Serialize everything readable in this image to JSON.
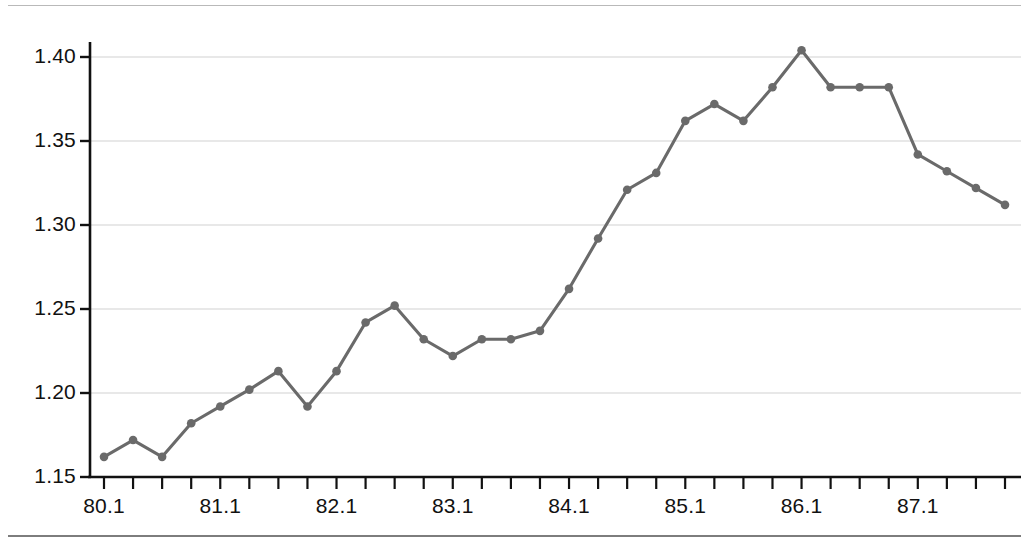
{
  "chart_data": {
    "type": "line",
    "title": "",
    "subtitle": "",
    "xlabel": "",
    "ylabel": "",
    "grid": true,
    "legend": false,
    "legend_position": "none",
    "series_color": "#6a6a6a",
    "marker": "circle",
    "xlim": [
      1980.1,
      87.4
    ],
    "ylim": [
      1.15,
      1.4125
    ],
    "yticks": [
      1.15,
      1.2,
      1.25,
      1.3,
      1.35,
      1.4
    ],
    "ytick_labels": [
      "1.15",
      "1.20",
      "1.25",
      "1.30",
      "1.35",
      "1.40"
    ],
    "xtick_labels": [
      "80.1",
      "81.1",
      "82.1",
      "83.1",
      "84.1",
      "85.1",
      "86.1",
      "87.1"
    ],
    "xtick_label_index": [
      0,
      4,
      8,
      12,
      16,
      20,
      24,
      28
    ],
    "x": [
      "80.1",
      "80.2",
      "80.3",
      "80.4",
      "81.1",
      "81.2",
      "81.3",
      "81.4",
      "82.1",
      "82.2",
      "82.3",
      "82.4",
      "83.1",
      "83.2",
      "83.3",
      "83.4",
      "84.1",
      "84.2",
      "84.3",
      "84.4",
      "85.1",
      "85.2",
      "85.3",
      "85.4",
      "86.1",
      "86.2",
      "86.3",
      "86.4",
      "87.1",
      "87.2",
      "87.3",
      "87.4"
    ],
    "series": [
      {
        "name": "series-1",
        "values": [
          1.162,
          1.172,
          1.162,
          1.182,
          1.192,
          1.202,
          1.213,
          1.192,
          1.213,
          1.242,
          1.252,
          1.232,
          1.222,
          1.232,
          1.232,
          1.237,
          1.262,
          1.292,
          1.321,
          1.331,
          1.362,
          1.372,
          1.362,
          1.382,
          1.404,
          1.382,
          1.382,
          1.382,
          1.342,
          1.332,
          1.322,
          1.312
        ]
      }
    ]
  },
  "axis": {
    "y_ticks": [
      "1.40",
      "1.35",
      "1.30",
      "1.25",
      "1.20",
      "1.15"
    ],
    "x_ticks": [
      "80.1",
      "81.1",
      "82.1",
      "83.1",
      "84.1",
      "85.1",
      "86.1",
      "87.1"
    ]
  }
}
